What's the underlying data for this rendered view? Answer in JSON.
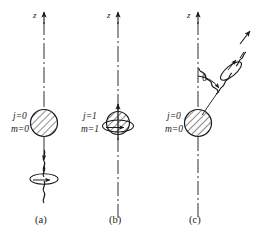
{
  "figure": {
    "type": "physics-diagram",
    "axis_label": "z",
    "angle_symbol": "θ",
    "stroke_color": "#1a1a1a",
    "background_color": "#ffffff",
    "panels": [
      {
        "id": "a",
        "label": "(a)",
        "j_label": "j=0",
        "m_label": "m=0",
        "axis_label": "z",
        "photon_direction": "down",
        "photon_angle_deg": 180,
        "has_spin_loop": false,
        "has_angle_arc": false
      },
      {
        "id": "b",
        "label": "(b)",
        "j_label": "j=1",
        "m_label": "m=1",
        "axis_label": "z",
        "photon_direction": "none",
        "photon_angle_deg": null,
        "has_spin_loop": true,
        "has_angle_arc": false
      },
      {
        "id": "c",
        "label": "(c)",
        "j_label": "j=0",
        "m_label": "m=0",
        "axis_label": "z",
        "photon_direction": "up-right",
        "photon_angle_deg": 40,
        "has_spin_loop": false,
        "has_angle_arc": true,
        "angle_symbol": "θ"
      }
    ],
    "caption_fragment": ""
  }
}
